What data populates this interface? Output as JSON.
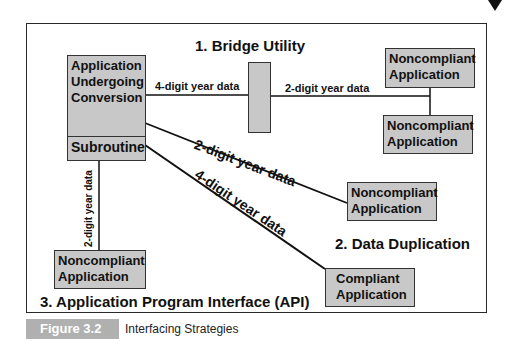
{
  "diagram": {
    "sections": {
      "bridge": "1.  Bridge Utility",
      "duplication": "2.  Data Duplication",
      "api": "3.  Application Program Interface (API)"
    },
    "nodes": {
      "app_main": [
        "Application",
        "Undergoing",
        "Conversion"
      ],
      "subroutine": "Subroutine",
      "bridge": "",
      "nc_top_right": [
        "Noncompliant",
        "Application"
      ],
      "nc_mid_right": [
        "Noncompliant",
        "Application"
      ],
      "nc_dup": [
        "Noncompliant",
        "Application"
      ],
      "compliant": [
        "Compliant",
        "Application"
      ],
      "nc_api": [
        "Noncompliant",
        "Application"
      ]
    },
    "edges": {
      "app_to_bridge": "4-digit year data",
      "bridge_to_nc": "2-digit year data",
      "app_to_nc_dup": "2-digit year data",
      "sub_to_compliant": "4-digit year data",
      "sub_to_nc_api": "2-digit year data"
    },
    "colors": {
      "box_fill": "#c8c8c8",
      "line": "#111111",
      "caption_tag": "#b0b0b0"
    }
  },
  "caption": {
    "tag": "Figure 3.2",
    "title": "Interfacing Strategies"
  }
}
